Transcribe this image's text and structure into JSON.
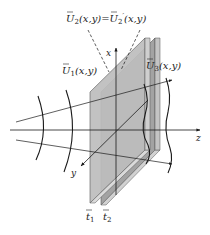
{
  "diagram": {
    "title": "",
    "labels": {
      "u2_equation": "Ũ2(x,y) = Ũ2'(x,y)",
      "u2_left_base": "U",
      "u2_left_sub": "2",
      "u2_args": "(x,y)",
      "equals": "=",
      "u2_right_base": "U",
      "u2_right_sub": "2",
      "u2_prime": "′",
      "u1_base": "U",
      "u1_sub": "1",
      "u1_args": "(x,y)",
      "u3_base": "U",
      "u3_sub": "3",
      "u3_args": "(x,y)",
      "axis_x": "x",
      "axis_y": "y",
      "axis_z": "z",
      "t1_base": "t",
      "t1_sub": "1",
      "t2_base": "t",
      "t2_sub": "2"
    },
    "elements": {
      "plates": [
        "transparency t1",
        "transparency t2"
      ],
      "wavefronts_left": 2,
      "wavefronts_right": 2,
      "rays": 3
    },
    "colors": {
      "plate_front": "#b8b8b8",
      "plate_back": "#9e9e9e",
      "plate_edge": "#d6d6d6",
      "line": "#1a1a1a"
    }
  }
}
